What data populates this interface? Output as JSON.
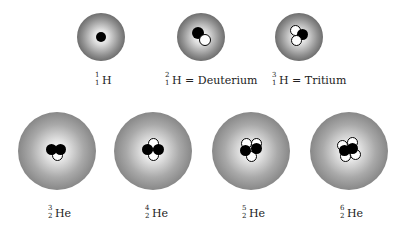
{
  "legend": {
    "proton_color": "#000000",
    "neutron_color": "#ffffff",
    "cloud_edge_color": "#6d6d6d"
  },
  "isotopes": [
    {
      "mass": "1",
      "atomic": "1",
      "symbol": "H",
      "name": "",
      "protons": 1,
      "neutrons": 0
    },
    {
      "mass": "2",
      "atomic": "1",
      "symbol": "H",
      "name": "= Deuterium",
      "protons": 1,
      "neutrons": 1
    },
    {
      "mass": "3",
      "atomic": "1",
      "symbol": "H",
      "name": "= Tritium",
      "protons": 1,
      "neutrons": 2
    },
    {
      "mass": "3",
      "atomic": "2",
      "symbol": "He",
      "name": "",
      "protons": 2,
      "neutrons": 1
    },
    {
      "mass": "4",
      "atomic": "2",
      "symbol": "He",
      "name": "",
      "protons": 2,
      "neutrons": 2
    },
    {
      "mass": "5",
      "atomic": "2",
      "symbol": "He",
      "name": "",
      "protons": 2,
      "neutrons": 3
    },
    {
      "mass": "6",
      "atomic": "2",
      "symbol": "He",
      "name": "",
      "protons": 2,
      "neutrons": 4
    }
  ]
}
